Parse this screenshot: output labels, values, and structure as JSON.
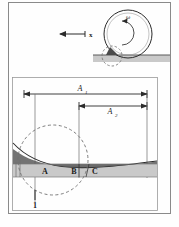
{
  "figure": {
    "name": "rolling-contact-deformation-diagram",
    "background": "#fefefe",
    "frame_color": "#8a8a8a",
    "ink_color": "#1a1a1a",
    "substrate_fill": "#c9c9c9",
    "wedge_fill": "#4a4a4a",
    "dashed_color": "#6e6e6e"
  },
  "top_panel": {
    "name": "rolling-wheel-panel",
    "wheel": {
      "label_omega": "ω",
      "outer_radius": 24,
      "inner_radius": 21,
      "center_x": 128,
      "center_y": 34
    },
    "direction_arrow": {
      "label": "x",
      "points": "left"
    },
    "contact_zone": {
      "dashed_circle_radius": 10,
      "has_dark_wedge": true
    }
  },
  "bottom_panel": {
    "name": "contact-zoom-panel",
    "dimensions": [
      {
        "label": "A",
        "sub": "1",
        "from_x": 23,
        "to_x": 147,
        "y": 94
      },
      {
        "label": "A",
        "sub": "2",
        "from_x": 78,
        "to_x": 147,
        "y": 107
      }
    ],
    "zones": [
      {
        "label": "A",
        "x": 45
      },
      {
        "label": "B",
        "x": 79
      },
      {
        "label": "C",
        "x": 96
      }
    ],
    "callouts": [
      {
        "label": "1",
        "x": 35,
        "y": 205
      }
    ],
    "dashed_circle": {
      "center_x": 53,
      "center_y": 160,
      "radius": 35
    },
    "substrate_band": {
      "top_y": 164,
      "bottom_y": 177
    }
  }
}
